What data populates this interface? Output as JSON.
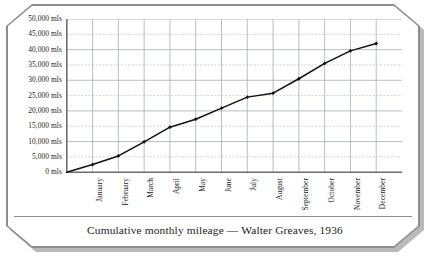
{
  "caption": "Cumulative monthly mileage — Walter Greaves, 1936",
  "chart_data": {
    "type": "line",
    "title": "Cumulative monthly mileage — Walter Greaves, 1936",
    "xlabel": "",
    "ylabel": "",
    "categories": [
      "January",
      "February",
      "March",
      "April",
      "May",
      "June",
      "July",
      "August",
      "September",
      "October",
      "November",
      "December"
    ],
    "values": [
      2500,
      5300,
      9900,
      14700,
      17300,
      20900,
      24500,
      25800,
      30500,
      35500,
      39600,
      42000
    ],
    "ytick_labels": [
      "50,000 mls",
      "45,000 mls",
      "40,000 mls",
      "35,000 mls",
      "30,000 mls",
      "25,000 mls",
      "20,000 mls",
      "15,000 mls",
      "10,000 mls",
      "5,000 mls",
      "0 mls"
    ],
    "ytick_values": [
      50000,
      45000,
      40000,
      35000,
      30000,
      25000,
      20000,
      15000,
      10000,
      5000,
      0
    ],
    "ylim": [
      0,
      50000
    ],
    "ytick_step": 5000,
    "grid": true,
    "grid_major_step": 10000,
    "grid_minor_step": 5000,
    "legend": null,
    "legend_position": "none",
    "marker": "diamond",
    "line_color": "#111111",
    "marker_color": "#111111",
    "grid_major_color": "#9aa3ae",
    "grid_minor_color": "#b9b1b1",
    "axis_color": "#6e6e6e",
    "plot_background": "#ffffff"
  },
  "frame": {
    "border_color": "#8d8d8d",
    "shadow_color": "#b9b9b9",
    "background": "#ffffff"
  }
}
